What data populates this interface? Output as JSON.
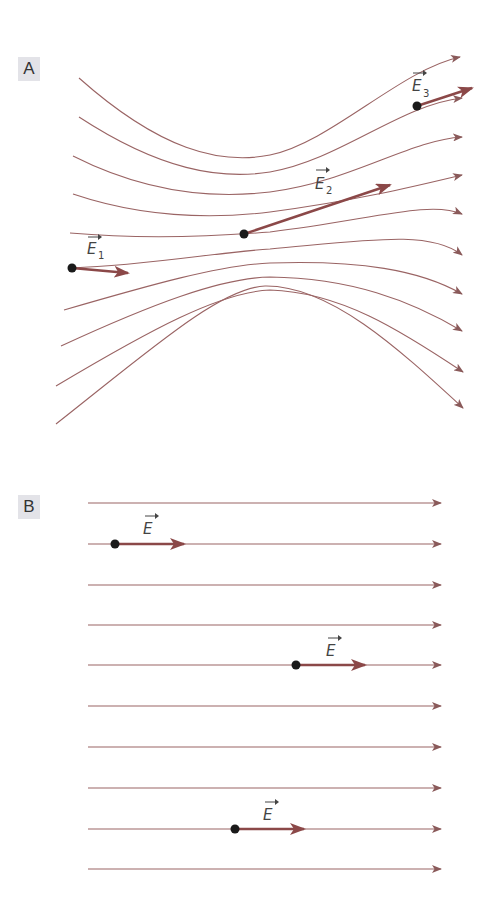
{
  "panels": [
    {
      "label": "A",
      "description": "Non-uniform electric field: field lines converge toward the middle and diverge on the right",
      "field_line_color": "#9a6464",
      "vector_color": "#8b4848",
      "vectors": [
        {
          "name": "E",
          "subscript": "1",
          "dot": [
            72,
            268
          ],
          "tip": [
            128,
            273
          ]
        },
        {
          "name": "E",
          "subscript": "2",
          "dot": [
            244,
            234
          ],
          "tip": [
            390,
            185
          ]
        },
        {
          "name": "E",
          "subscript": "3",
          "dot": [
            417,
            106
          ],
          "tip": [
            472,
            88
          ]
        }
      ],
      "line_count": 10
    },
    {
      "label": "B",
      "description": "Uniform electric field: parallel equally spaced field lines, equal vectors",
      "field_line_color": "#9a6464",
      "vector_color": "#8b4848",
      "vectors": [
        {
          "name": "E",
          "subscript": "",
          "dot": [
            115,
            544
          ],
          "tip": [
            184,
            544
          ]
        },
        {
          "name": "E",
          "subscript": "",
          "dot": [
            296,
            665
          ],
          "tip": [
            365,
            665
          ]
        },
        {
          "name": "E",
          "subscript": "",
          "dot": [
            235,
            829
          ],
          "tip": [
            304,
            829
          ]
        }
      ],
      "line_count": 10
    }
  ],
  "labels": {
    "panel_a": "A",
    "panel_b": "B",
    "e1_main": "E",
    "e1_sub": "1",
    "e2_main": "E",
    "e2_sub": "2",
    "e3_main": "E",
    "e3_sub": "3",
    "eb1": "E",
    "eb2": "E",
    "eb3": "E"
  }
}
